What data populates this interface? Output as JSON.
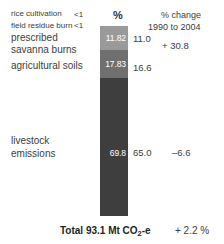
{
  "chart_data": {
    "type": "bar",
    "title": "",
    "subtitle": "",
    "orientation": "vertical-stacked",
    "unit": "Mt CO2-e",
    "value_axis_label": "%",
    "categories": [
      "rice cultivation",
      "field residue burn",
      "prescribed savanna burns",
      "agricultural soils",
      "livestock emissions"
    ],
    "series": [
      {
        "name": "emissions",
        "values": [
          null,
          null,
          11.82,
          17.83,
          69.8
        ],
        "percent_values": [
          null,
          null,
          11.0,
          16.6,
          65.0
        ],
        "percent_change_1990_2004": [
          null,
          null,
          30.8,
          null,
          -6.6
        ]
      }
    ],
    "total_value": 93.1,
    "total_unit": "Mt CO2-e",
    "total_change_percent": 2.2,
    "segment_colors": [
      "#9a9a9a",
      "#6f6f6f",
      "#3e3e3e"
    ],
    "grid": false,
    "legend": "none"
  },
  "labels": {
    "rice_cultivation": "rice cultivation",
    "field_residue_burn": "field residue burn",
    "prescribed": "prescribed",
    "savanna_burns": "savanna burns",
    "agricultural_soils": "agricultural soils",
    "livestock_1": "livestock",
    "livestock_2": "emissions"
  },
  "small_values": {
    "rice_cultivation": "<1",
    "field_residue_burn": "<1"
  },
  "headers": {
    "percent_symbol": "%",
    "change_line1": "% change",
    "change_line2": "1990 to 2004"
  },
  "bar_values": {
    "prescribed": "11.82",
    "agricultural_soils": "17.83",
    "livestock": "69.8"
  },
  "percent_values": {
    "prescribed": "11.0",
    "agricultural_soils": "16.6",
    "livestock": "65.0"
  },
  "change_values": {
    "prescribed": "+ 30.8",
    "livestock": "–6.6"
  },
  "total": {
    "prefix": "Total 93.1 Mt CO",
    "subscript": "2",
    "suffix": "-e",
    "change": "+ 2.2 %"
  },
  "colors": {
    "segment_light": "#9a9a9a",
    "segment_mid": "#6f6f6f",
    "segment_dark": "#3e3e3e",
    "text": "#3d3d3d",
    "background": "#ffffff"
  }
}
